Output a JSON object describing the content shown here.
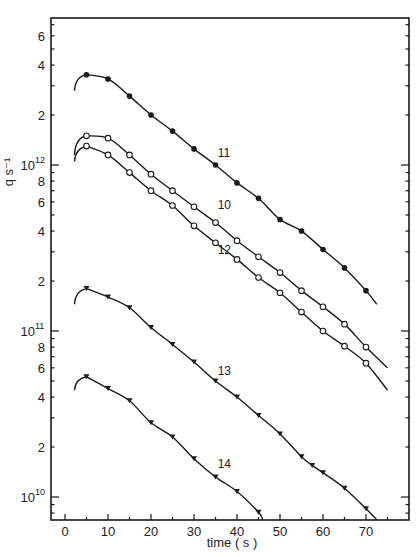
{
  "chart_data": {
    "type": "line",
    "title": "",
    "xlabel": "time  ( s )",
    "ylabel": "q s⁻¹",
    "xscale": "linear",
    "yscale": "log",
    "xlim": [
      -2,
      77
    ],
    "ylim": [
      7000000000.0,
      7000000000000.0
    ],
    "grid": false,
    "legend": "none (series labelled inline)",
    "x_ticks": [
      0,
      10,
      20,
      30,
      40,
      50,
      60,
      70
    ],
    "y_tick_labels": [
      {
        "value": 10000000000.0,
        "label": "10",
        "exp": "10"
      },
      {
        "value": 20000000000.0,
        "label": "2"
      },
      {
        "value": 40000000000.0,
        "label": "4"
      },
      {
        "value": 60000000000.0,
        "label": "6"
      },
      {
        "value": 80000000000.0,
        "label": "8"
      },
      {
        "value": 100000000000.0,
        "label": "10",
        "exp": "11"
      },
      {
        "value": 200000000000.0,
        "label": "2"
      },
      {
        "value": 400000000000.0,
        "label": "4"
      },
      {
        "value": 600000000000.0,
        "label": "6"
      },
      {
        "value": 800000000000.0,
        "label": "8"
      },
      {
        "value": 1000000000000.0,
        "label": "10",
        "exp": "12"
      },
      {
        "value": 2000000000000.0,
        "label": "2"
      },
      {
        "value": 4000000000000.0,
        "label": "4"
      },
      {
        "value": 6000000000000.0,
        "label": "6"
      }
    ],
    "series": [
      {
        "name": "11",
        "marker": "filled-circle",
        "label_pos": {
          "t": 35.5,
          "v": 1120000000000.0
        },
        "start": {
          "t": 2.2,
          "v": 2800000000000.0
        },
        "end": {
          "t": 72.5,
          "v": 145000000000.0
        },
        "x": [
          5,
          10,
          15,
          20,
          25,
          30,
          35,
          40,
          45,
          50,
          55,
          60,
          65,
          70
        ],
        "values": [
          3500000000000.0,
          3300000000000.0,
          2600000000000.0,
          2000000000000.0,
          1600000000000.0,
          1250000000000.0,
          1000000000000.0,
          780000000000.0,
          630000000000.0,
          470000000000.0,
          400000000000.0,
          310000000000.0,
          240000000000.0,
          175000000000.0
        ]
      },
      {
        "name": "10",
        "marker": "open-circle",
        "label_pos": {
          "t": 35.5,
          "v": 540000000000.0
        },
        "start": {
          "t": 2.2,
          "v": 1150000000000.0
        },
        "end": {
          "t": 75,
          "v": 60000000000.0
        },
        "x": [
          5,
          10,
          15,
          20,
          25,
          30,
          35,
          40,
          45,
          50,
          55,
          60,
          65,
          70
        ],
        "values": [
          1500000000000.0,
          1450000000000.0,
          1150000000000.0,
          880000000000.0,
          700000000000.0,
          560000000000.0,
          450000000000.0,
          350000000000.0,
          280000000000.0,
          225000000000.0,
          175000000000.0,
          140000000000.0,
          110000000000.0,
          80000000000.0
        ]
      },
      {
        "name": "12",
        "marker": "open-circle",
        "label_pos": {
          "t": 35.5,
          "v": 290000000000.0
        },
        "start": {
          "t": 2.2,
          "v": 1050000000000.0
        },
        "end": {
          "t": 75,
          "v": 44000000000.0
        },
        "x": [
          5,
          10,
          15,
          20,
          25,
          30,
          35,
          40,
          45,
          50,
          55,
          60,
          65,
          70
        ],
        "values": [
          1300000000000.0,
          1150000000000.0,
          900000000000.0,
          700000000000.0,
          570000000000.0,
          430000000000.0,
          340000000000.0,
          270000000000.0,
          210000000000.0,
          170000000000.0,
          130000000000.0,
          100000000000.0,
          81000000000.0,
          64000000000.0
        ]
      },
      {
        "name": "13",
        "marker": "filled-triangle-down",
        "label_pos": {
          "t": 35.5,
          "v": 54000000000.0
        },
        "start": {
          "t": 2.2,
          "v": 145000000000.0
        },
        "end": {
          "t": 72.5,
          "v": 7300000000.0
        },
        "x": [
          5,
          10,
          15,
          20,
          25,
          30,
          35,
          40,
          45,
          50,
          55,
          57.5,
          60,
          65,
          70
        ],
        "values": [
          180000000000.0,
          160000000000.0,
          138000000000.0,
          105000000000.0,
          83000000000.0,
          65000000000.0,
          50000000000.0,
          40000000000.0,
          31000000000.0,
          24000000000.0,
          17500000000.0,
          15500000000.0,
          14000000000.0,
          11300000000.0,
          8500000000.0
        ]
      },
      {
        "name": "14",
        "marker": "filled-triangle-down",
        "label_pos": {
          "t": 35.5,
          "v": 15000000000.0
        },
        "start": {
          "t": 2.2,
          "v": 44000000000.0
        },
        "end": {
          "t": 46,
          "v": 7300000000.0
        },
        "x": [
          5,
          10,
          15,
          20,
          25,
          30,
          35,
          40,
          45
        ],
        "values": [
          53000000000.0,
          45000000000.0,
          38000000000.0,
          28000000000.0,
          23000000000.0,
          17000000000.0,
          13200000000.0,
          10800000000.0,
          8100000000.0
        ]
      }
    ]
  },
  "plot_area": {
    "left": 51,
    "top": 18,
    "right": 409,
    "bottom": 520
  },
  "colors": {
    "ink": "#1a1a1a",
    "background": "#ffffff"
  }
}
